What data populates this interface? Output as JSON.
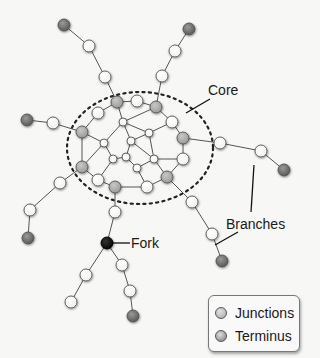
{
  "colors": {
    "background": "#f7f7f5",
    "edge": "#555555",
    "ellipse": "#222222",
    "normal_fill": "#ffffff",
    "junction_fill": "#a9a9a9",
    "terminus_fill": "#7a7a7a",
    "fork_fill": "#111111",
    "node_stroke": "#555555"
  },
  "core_region": {
    "cx": 140,
    "cy": 148,
    "rx": 73,
    "ry": 56
  },
  "nodes": [
    {
      "id": "j1",
      "x": 117,
      "y": 102,
      "r": 6,
      "type": "junction"
    },
    {
      "id": "c1",
      "x": 137,
      "y": 101,
      "r": 6,
      "type": "normal"
    },
    {
      "id": "j2",
      "x": 156,
      "y": 107,
      "r": 6,
      "type": "junction"
    },
    {
      "id": "c2",
      "x": 98,
      "y": 113,
      "r": 6,
      "type": "normal"
    },
    {
      "id": "c3",
      "x": 123,
      "y": 122,
      "r": 4,
      "type": "normal"
    },
    {
      "id": "c4",
      "x": 172,
      "y": 122,
      "r": 6,
      "type": "normal"
    },
    {
      "id": "j3",
      "x": 82,
      "y": 132,
      "r": 6,
      "type": "junction"
    },
    {
      "id": "c5",
      "x": 149,
      "y": 133,
      "r": 4,
      "type": "normal"
    },
    {
      "id": "j4",
      "x": 183,
      "y": 138,
      "r": 6,
      "type": "junction"
    },
    {
      "id": "c6",
      "x": 131,
      "y": 141,
      "r": 4,
      "type": "normal"
    },
    {
      "id": "c7",
      "x": 104,
      "y": 143,
      "r": 4,
      "type": "normal"
    },
    {
      "id": "c8",
      "x": 113,
      "y": 159,
      "r": 4,
      "type": "normal"
    },
    {
      "id": "c9",
      "x": 126,
      "y": 157,
      "r": 4,
      "type": "normal"
    },
    {
      "id": "c10",
      "x": 154,
      "y": 159,
      "r": 4,
      "type": "normal"
    },
    {
      "id": "c11",
      "x": 183,
      "y": 159,
      "r": 6,
      "type": "normal"
    },
    {
      "id": "c12",
      "x": 137,
      "y": 168,
      "r": 4,
      "type": "normal"
    },
    {
      "id": "j5",
      "x": 82,
      "y": 167,
      "r": 6,
      "type": "junction"
    },
    {
      "id": "j6",
      "x": 167,
      "y": 177,
      "r": 6,
      "type": "junction"
    },
    {
      "id": "c13",
      "x": 98,
      "y": 180,
      "r": 6,
      "type": "normal"
    },
    {
      "id": "j7",
      "x": 115,
      "y": 187,
      "r": 6,
      "type": "junction"
    },
    {
      "id": "c14",
      "x": 147,
      "y": 187,
      "r": 6,
      "type": "normal"
    },
    {
      "id": "b1a",
      "x": 105,
      "y": 77,
      "r": 6,
      "type": "normal"
    },
    {
      "id": "b1b",
      "x": 89,
      "y": 46,
      "r": 6,
      "type": "normal"
    },
    {
      "id": "t1",
      "x": 64,
      "y": 25,
      "r": 6,
      "type": "terminus"
    },
    {
      "id": "b2a",
      "x": 162,
      "y": 76,
      "r": 6,
      "type": "normal"
    },
    {
      "id": "b2b",
      "x": 175,
      "y": 51,
      "r": 6,
      "type": "normal"
    },
    {
      "id": "t2",
      "x": 189,
      "y": 29,
      "r": 6,
      "type": "terminus"
    },
    {
      "id": "b3a",
      "x": 53,
      "y": 123,
      "r": 6,
      "type": "normal"
    },
    {
      "id": "t3",
      "x": 27,
      "y": 120,
      "r": 6,
      "type": "terminus"
    },
    {
      "id": "b4a",
      "x": 220,
      "y": 143,
      "r": 6,
      "type": "normal"
    },
    {
      "id": "b4b",
      "x": 261,
      "y": 151,
      "r": 6,
      "type": "normal"
    },
    {
      "id": "t4",
      "x": 284,
      "y": 170,
      "r": 6,
      "type": "terminus"
    },
    {
      "id": "b5a",
      "x": 60,
      "y": 183,
      "r": 6,
      "type": "normal"
    },
    {
      "id": "b5b",
      "x": 30,
      "y": 210,
      "r": 6,
      "type": "normal"
    },
    {
      "id": "t5",
      "x": 28,
      "y": 238,
      "r": 6,
      "type": "terminus"
    },
    {
      "id": "b6a",
      "x": 192,
      "y": 202,
      "r": 6,
      "type": "normal"
    },
    {
      "id": "b6b",
      "x": 212,
      "y": 234,
      "r": 6,
      "type": "normal"
    },
    {
      "id": "t6",
      "x": 222,
      "y": 261,
      "r": 6,
      "type": "terminus"
    },
    {
      "id": "b7a",
      "x": 115,
      "y": 212,
      "r": 6,
      "type": "normal"
    },
    {
      "id": "fork",
      "x": 107,
      "y": 243,
      "r": 6,
      "type": "fork"
    },
    {
      "id": "b8a",
      "x": 86,
      "y": 275,
      "r": 6,
      "type": "normal"
    },
    {
      "id": "b8b",
      "x": 71,
      "y": 302,
      "r": 6,
      "type": "normal"
    },
    {
      "id": "b9a",
      "x": 122,
      "y": 265,
      "r": 6,
      "type": "normal"
    },
    {
      "id": "b9b",
      "x": 130,
      "y": 291,
      "r": 6,
      "type": "normal"
    },
    {
      "id": "t7",
      "x": 133,
      "y": 316,
      "r": 6,
      "type": "terminus"
    }
  ],
  "edges": [
    [
      "j1",
      "c1"
    ],
    [
      "c1",
      "j2"
    ],
    [
      "j1",
      "c2"
    ],
    [
      "c2",
      "j3"
    ],
    [
      "j1",
      "c3"
    ],
    [
      "c3",
      "j2"
    ],
    [
      "j2",
      "c4"
    ],
    [
      "c4",
      "j4"
    ],
    [
      "c3",
      "c7"
    ],
    [
      "c3",
      "c6"
    ],
    [
      "c3",
      "c5"
    ],
    [
      "c5",
      "c4"
    ],
    [
      "c5",
      "c10"
    ],
    [
      "c6",
      "c5"
    ],
    [
      "c6",
      "c9"
    ],
    [
      "c6",
      "c10"
    ],
    [
      "j3",
      "c7"
    ],
    [
      "j3",
      "j5"
    ],
    [
      "c7",
      "c8"
    ],
    [
      "c7",
      "j5"
    ],
    [
      "c8",
      "c9"
    ],
    [
      "c8",
      "c13"
    ],
    [
      "c9",
      "c12"
    ],
    [
      "c12",
      "c10"
    ],
    [
      "c10",
      "c11"
    ],
    [
      "c11",
      "j4"
    ],
    [
      "c10",
      "j6"
    ],
    [
      "c12",
      "c14"
    ],
    [
      "c14",
      "j6"
    ],
    [
      "j6",
      "c11"
    ],
    [
      "j5",
      "c13"
    ],
    [
      "c13",
      "j7"
    ],
    [
      "j7",
      "c14"
    ],
    [
      "j1",
      "b1a"
    ],
    [
      "b1a",
      "b1b"
    ],
    [
      "b1b",
      "t1"
    ],
    [
      "j2",
      "b2a"
    ],
    [
      "b2a",
      "b2b"
    ],
    [
      "b2b",
      "t2"
    ],
    [
      "j3",
      "b3a"
    ],
    [
      "b3a",
      "t3"
    ],
    [
      "j4",
      "b4a"
    ],
    [
      "b4a",
      "b4b"
    ],
    [
      "b4b",
      "t4"
    ],
    [
      "j5",
      "b5a"
    ],
    [
      "b5a",
      "b5b"
    ],
    [
      "b5b",
      "t5"
    ],
    [
      "j6",
      "b6a"
    ],
    [
      "b6a",
      "b6b"
    ],
    [
      "b6b",
      "t6"
    ],
    [
      "j7",
      "b7a"
    ],
    [
      "b7a",
      "fork"
    ],
    [
      "fork",
      "b8a"
    ],
    [
      "b8a",
      "b8b"
    ],
    [
      "fork",
      "b9a"
    ],
    [
      "b9a",
      "b9b"
    ],
    [
      "b9b",
      "t7"
    ]
  ],
  "callouts": [
    {
      "id": "core",
      "text": "Core",
      "x": 208,
      "y": 83,
      "lines": [
        [
          210,
          99,
          186,
          113
        ]
      ]
    },
    {
      "id": "branches",
      "text": "Branches",
      "x": 226,
      "y": 217,
      "lines": [
        [
          254,
          165,
          251,
          212
        ],
        [
          238,
          232,
          215,
          245
        ]
      ]
    },
    {
      "id": "fork",
      "text": "Fork",
      "x": 131,
      "y": 236,
      "lines": [
        [
          113,
          243,
          130,
          243
        ]
      ]
    }
  ],
  "legend": {
    "items": [
      {
        "label": "Junctions",
        "swatch": "#a9a9a9"
      },
      {
        "label": "Terminus",
        "swatch": "#7a7a7a"
      }
    ]
  }
}
